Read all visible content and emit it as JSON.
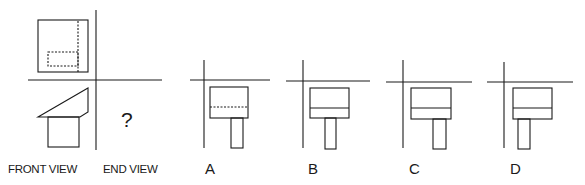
{
  "question": {
    "front_view_label": "FRONT VIEW",
    "end_view_label": "END VIEW",
    "unknown_mark": "?"
  },
  "options": [
    {
      "letter": "A",
      "middle_line": "dashed",
      "stem_position": "right"
    },
    {
      "letter": "B",
      "middle_line": "solid",
      "stem_position": "center"
    },
    {
      "letter": "C",
      "middle_line": "solid",
      "stem_position": "right"
    },
    {
      "letter": "D",
      "middle_line": "solid",
      "stem_position": "left"
    }
  ],
  "colors": {
    "line": "#1a1a1a",
    "background": "#ffffff"
  }
}
